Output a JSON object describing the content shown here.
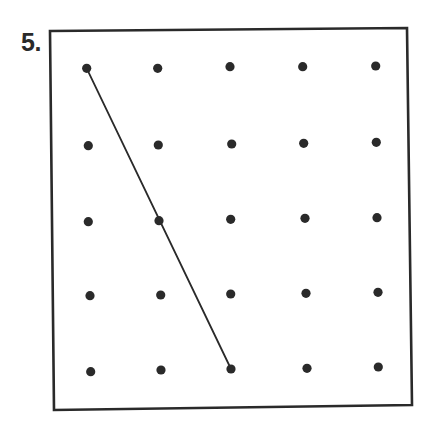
{
  "problem": {
    "number_label": "5."
  },
  "colors": {
    "ink": "#2a2a2a",
    "background": "#ffffff"
  },
  "geoboard": {
    "frame": {
      "points": [
        [
          50,
          31
        ],
        [
          407,
          28
        ],
        [
          412,
          405
        ],
        [
          54,
          410
        ]
      ],
      "stroke_width": 2.6
    },
    "dot_radius": 4.6,
    "rows": 5,
    "cols": 5,
    "dots": [
      [
        [
          86.7,
          68.3
        ],
        [
          157.7,
          68.3
        ],
        [
          230.0,
          66.7
        ],
        [
          302.7,
          66.7
        ],
        [
          375.7,
          66.0
        ]
      ],
      [
        [
          88.3,
          145.7
        ],
        [
          158.3,
          145.0
        ],
        [
          231.7,
          144.0
        ],
        [
          303.7,
          143.3
        ],
        [
          376.3,
          142.3
        ]
      ],
      [
        [
          88.3,
          221.7
        ],
        [
          159.0,
          220.7
        ],
        [
          230.7,
          219.3
        ],
        [
          305.0,
          218.3
        ],
        [
          377.0,
          217.7
        ]
      ],
      [
        [
          90.0,
          295.7
        ],
        [
          160.7,
          295.0
        ],
        [
          230.7,
          294.0
        ],
        [
          306.0,
          293.3
        ],
        [
          378.0,
          292.3
        ]
      ],
      [
        [
          90.7,
          371.7
        ],
        [
          161.0,
          370.0
        ],
        [
          231.0,
          369.0
        ],
        [
          307.0,
          368.3
        ],
        [
          378.3,
          367.0
        ]
      ]
    ],
    "segments": [
      {
        "from": {
          "row": 1,
          "col": 1
        },
        "to": {
          "row": 5,
          "col": 3
        },
        "passes_through": {
          "row": 3,
          "col": 2
        },
        "stroke_width": 1.8
      }
    ]
  }
}
